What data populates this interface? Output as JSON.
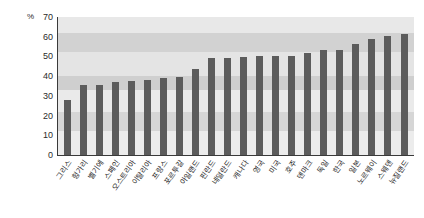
{
  "chart_data": {
    "type": "bar",
    "title": "",
    "xlabel": "",
    "ylabel": "%",
    "unit_label": "%",
    "ylim": [
      0,
      70
    ],
    "ytick_step": 10,
    "yticks": [
      "70",
      "60",
      "50",
      "40",
      "30",
      "20",
      "10",
      "0"
    ],
    "grid": false,
    "legend": "none",
    "bar_color": "#5c5c5c",
    "plot_background": "#ededed",
    "band_color": "#d4d4d4",
    "categories": [
      "그리스",
      "헝가리",
      "벨기에",
      "스페인",
      "오스트리아",
      "이탈리아",
      "프랑스",
      "포르투갈",
      "아일랜드",
      "핀란드",
      "네덜란드",
      "캐나다",
      "영국",
      "미국",
      "호주",
      "덴마크",
      "독일",
      "한국",
      "일본",
      "노르웨이",
      "스웨덴",
      "뉴질랜드"
    ],
    "values": [
      28,
      35.5,
      35.5,
      37,
      37.5,
      38,
      39,
      39.5,
      43.5,
      49,
      49,
      49.5,
      50,
      50,
      50,
      51.5,
      53.5,
      53.5,
      56.5,
      59,
      60.5,
      61.5
    ]
  }
}
